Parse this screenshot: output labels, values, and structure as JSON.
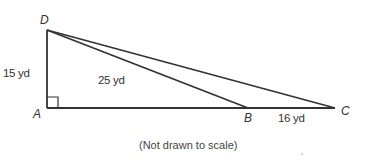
{
  "diagram": {
    "type": "right-triangle-geometry",
    "points": [
      {
        "label": "D"
      },
      {
        "label": "A"
      },
      {
        "label": "B"
      },
      {
        "label": "C"
      }
    ],
    "measurements": {
      "DA": "15 yd",
      "DB": "25 yd",
      "BC": "16 yd"
    },
    "right_angle_at": "A",
    "note": "(Not drawn to scale)"
  }
}
